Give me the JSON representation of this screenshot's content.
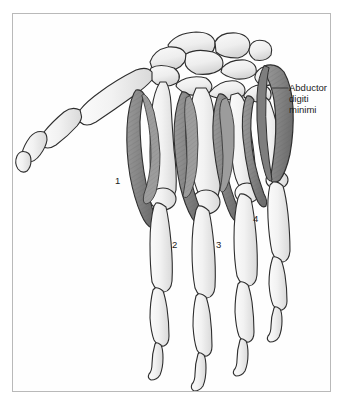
{
  "figure": {
    "frame_color": "#b9b9b9",
    "background_color": "#ffffff"
  },
  "callout": {
    "line1": "Abductor",
    "line2": "digiti",
    "line3": "minimi",
    "leader_color": "#3a3a3a"
  },
  "numbers": [
    {
      "label": "1",
      "x": 115,
      "y": 175
    },
    {
      "label": "2",
      "x": 172,
      "y": 239
    },
    {
      "label": "3",
      "x": 216,
      "y": 239
    },
    {
      "label": "4",
      "x": 253,
      "y": 213
    }
  ],
  "colors": {
    "bone_fill": "#efefef",
    "bone_fill_light": "#f6f6f6",
    "bone_outline": "#2e2e2e",
    "muscle_fill": "#8d8d8d",
    "muscle_fill_dark": "#7c7c7c",
    "muscle_outline": "#2e2e2e",
    "text": "#1b1b1b"
  }
}
